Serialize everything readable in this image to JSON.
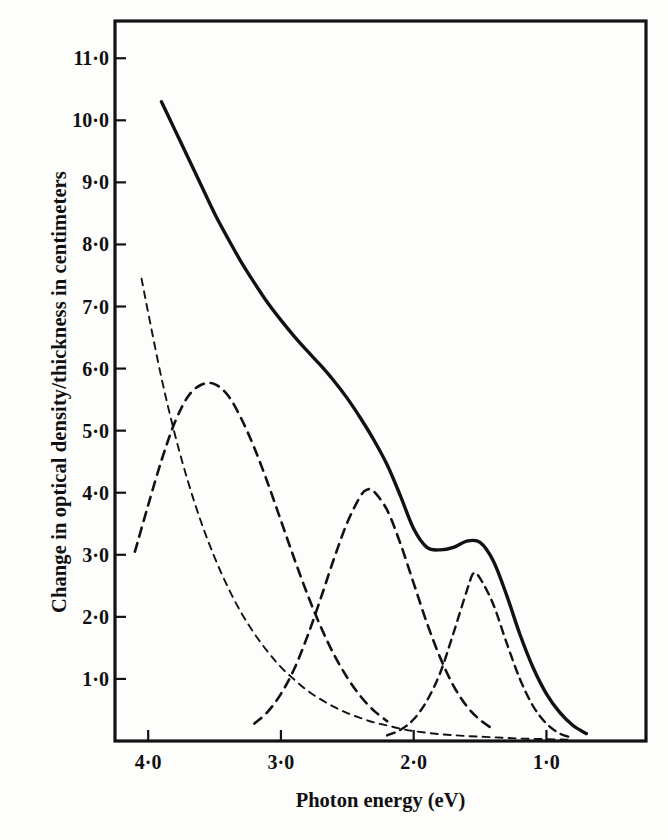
{
  "figure": {
    "background_color": "#fdfdfc",
    "ink_color": "#121212"
  },
  "axes": {
    "x_title": "Photon energy (eV)",
    "y_title": "Change in optical density/thickness in centimeters",
    "x_tick_labels": [
      "4·0",
      "3·0",
      "2·0",
      "1·0"
    ],
    "y_tick_labels": [
      "11·0",
      "10·0",
      "9·0",
      "8·0",
      "7·0",
      "6·0",
      "5·0",
      "4·0",
      "3·0",
      "2·0",
      "1·0"
    ]
  },
  "chart_data": {
    "type": "line",
    "title": "",
    "xlabel": "Photon energy (eV)",
    "ylabel": "Change in optical density/thickness in centimeters",
    "xlim": [
      4.25,
      0.25
    ],
    "ylim": [
      0,
      11.6
    ],
    "x_reversed": true,
    "grid": false,
    "legend": "none",
    "x_ticks": [
      4.0,
      3.0,
      2.0,
      1.0
    ],
    "y_ticks": [
      1.0,
      2.0,
      3.0,
      4.0,
      5.0,
      6.0,
      7.0,
      8.0,
      9.0,
      10.0,
      11.0
    ],
    "series": [
      {
        "name": "total-absorption-curve",
        "style": "solid",
        "description": "Measured total change in optical density per thickness; monotonic decrease from high photon energy with a shoulder near 1.9 eV and a bump near 1.55 eV.",
        "x": [
          3.9,
          3.8,
          3.7,
          3.6,
          3.5,
          3.4,
          3.3,
          3.2,
          3.1,
          3.0,
          2.9,
          2.8,
          2.7,
          2.6,
          2.5,
          2.4,
          2.3,
          2.2,
          2.1,
          2.0,
          1.9,
          1.8,
          1.7,
          1.6,
          1.5,
          1.4,
          1.3,
          1.2,
          1.1,
          1.0,
          0.9,
          0.8,
          0.7
        ],
        "y": [
          10.3,
          9.85,
          9.4,
          8.95,
          8.5,
          8.1,
          7.72,
          7.38,
          7.06,
          6.78,
          6.52,
          6.28,
          6.05,
          5.8,
          5.52,
          5.2,
          4.85,
          4.45,
          3.95,
          3.42,
          3.12,
          3.08,
          3.12,
          3.22,
          3.2,
          2.9,
          2.35,
          1.72,
          1.18,
          0.76,
          0.46,
          0.25,
          0.12
        ]
      },
      {
        "name": "component-1-exponential-tail",
        "style": "dashed",
        "description": "Steeply falling ultraviolet tail component; 7.45 at 4.05 eV falling through 4.0 at 4.0 eV to near zero by 2.2 eV, with a very long low tail.",
        "x": [
          4.05,
          4.0,
          3.9,
          3.8,
          3.7,
          3.6,
          3.5,
          3.4,
          3.3,
          3.2,
          3.1,
          3.0,
          2.9,
          2.8,
          2.7,
          2.6,
          2.5,
          2.4,
          2.3,
          2.2,
          2.1,
          2.0,
          1.8,
          1.6,
          1.4,
          1.2,
          1.0,
          0.8
        ],
        "y": [
          7.45,
          6.9,
          5.85,
          4.95,
          4.18,
          3.52,
          2.96,
          2.48,
          2.07,
          1.73,
          1.44,
          1.19,
          0.99,
          0.81,
          0.67,
          0.55,
          0.45,
          0.37,
          0.3,
          0.25,
          0.2,
          0.16,
          0.11,
          0.08,
          0.06,
          0.04,
          0.03,
          0.02
        ]
      },
      {
        "name": "component-2-gaussian-3p5eV",
        "style": "dashed",
        "description": "Broad Gaussian band centred near 3.5 eV with peak height 5.75.",
        "peak_x": 3.5,
        "peak_y": 5.75,
        "fwhm": 1.15,
        "x": [
          4.1,
          4.0,
          3.9,
          3.8,
          3.7,
          3.6,
          3.5,
          3.4,
          3.3,
          3.2,
          3.1,
          3.0,
          2.9,
          2.8,
          2.7,
          2.6,
          2.5,
          2.4,
          2.3,
          2.2
        ],
        "y": [
          3.05,
          3.8,
          4.52,
          5.13,
          5.55,
          5.74,
          5.75,
          5.57,
          5.2,
          4.72,
          4.16,
          3.55,
          2.94,
          2.36,
          1.84,
          1.39,
          1.02,
          0.72,
          0.49,
          0.32
        ]
      },
      {
        "name": "component-3-gaussian-2p35eV",
        "style": "dashed",
        "description": "Gaussian band centred near 2.35 eV with peak height 4.05.",
        "peak_x": 2.35,
        "peak_y": 4.05,
        "fwhm": 0.9,
        "x": [
          3.2,
          3.1,
          3.0,
          2.9,
          2.8,
          2.7,
          2.6,
          2.5,
          2.4,
          2.35,
          2.3,
          2.2,
          2.1,
          2.0,
          1.9,
          1.8,
          1.7,
          1.6,
          1.5,
          1.4
        ],
        "y": [
          0.28,
          0.47,
          0.76,
          1.16,
          1.69,
          2.3,
          2.94,
          3.52,
          3.95,
          4.05,
          4.02,
          3.72,
          3.18,
          2.54,
          1.9,
          1.34,
          0.89,
          0.56,
          0.34,
          0.19
        ]
      },
      {
        "name": "component-4-gaussian-1p55eV",
        "style": "dashed",
        "description": "Gaussian band centred near 1.55 eV with peak height 2.70.",
        "peak_x": 1.55,
        "peak_y": 2.7,
        "fwhm": 0.62,
        "x": [
          2.2,
          2.1,
          2.0,
          1.9,
          1.8,
          1.7,
          1.6,
          1.55,
          1.5,
          1.4,
          1.3,
          1.2,
          1.1,
          1.0,
          0.9,
          0.8
        ],
        "y": [
          0.09,
          0.18,
          0.35,
          0.65,
          1.1,
          1.74,
          2.42,
          2.7,
          2.62,
          2.2,
          1.58,
          1.0,
          0.56,
          0.28,
          0.12,
          0.05
        ]
      }
    ]
  }
}
